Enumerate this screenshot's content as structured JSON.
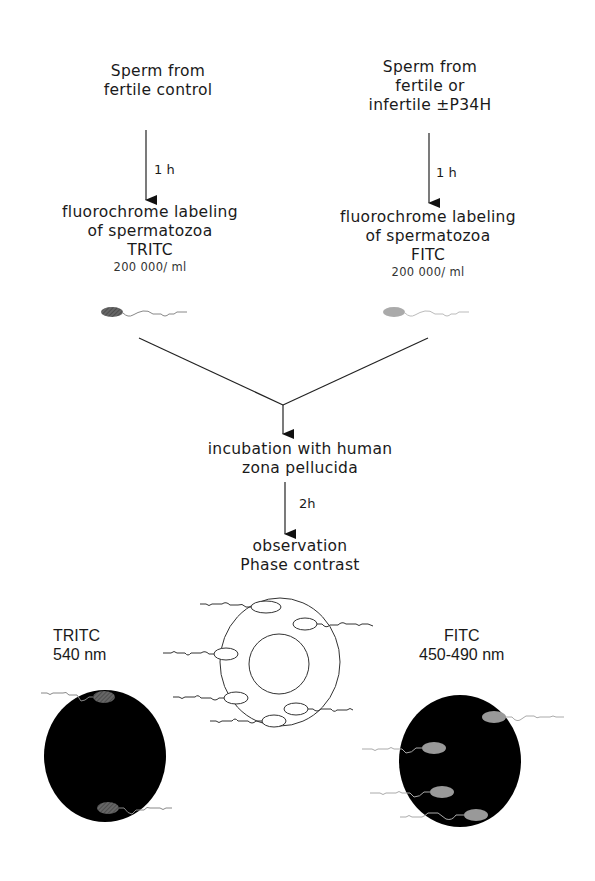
{
  "diagram": {
    "left_branch": {
      "source": [
        "Sperm from",
        "fertile control"
      ],
      "incubation_time": "1 h",
      "labeling": [
        "fluorochrome labeling",
        "of spermatozoa",
        "TRITC"
      ],
      "concentration": "200 000/ ml",
      "sperm_color": "#555555"
    },
    "right_branch": {
      "source": [
        "Sperm from",
        "fertile or",
        "infertile ±P34H"
      ],
      "incubation_time": "1 h",
      "labeling": [
        "fluorochrome labeling",
        "of spermatozoa",
        "FITC"
      ],
      "concentration": "200 000/ ml",
      "sperm_color": "#aaaaaa"
    },
    "merge_step": [
      "incubation with human",
      "zona pellucida"
    ],
    "merge_time": "2h",
    "observation": [
      "observation",
      "Phase contrast"
    ],
    "results": {
      "tritc": [
        "TRITC",
        "540 nm"
      ],
      "fitc": [
        "FITC",
        "450-490 nm"
      ]
    }
  }
}
